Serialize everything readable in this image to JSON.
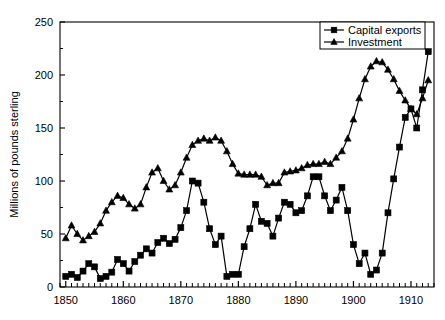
{
  "chart_data": {
    "type": "line",
    "title": "",
    "xlabel": "",
    "ylabel": "Millions of pounds sterling",
    "xlim": [
      1849,
      1914
    ],
    "ylim": [
      0,
      250
    ],
    "yticks": [
      0,
      50,
      100,
      150,
      200,
      250
    ],
    "xticks": [
      1850,
      1860,
      1870,
      1880,
      1890,
      1900,
      1910
    ],
    "xtick_labels": [
      "1850",
      "1860",
      "1870",
      "1880",
      "1890",
      "1900",
      "1910"
    ],
    "ytick_labels": [
      "0",
      "50",
      "100",
      "150",
      "200",
      "250"
    ],
    "minor_xticks": true,
    "grid": false,
    "legend_position": "top-right",
    "x": [
      1850,
      1851,
      1852,
      1853,
      1854,
      1855,
      1856,
      1857,
      1858,
      1859,
      1860,
      1861,
      1862,
      1863,
      1864,
      1865,
      1866,
      1867,
      1868,
      1869,
      1870,
      1871,
      1872,
      1873,
      1874,
      1875,
      1876,
      1877,
      1878,
      1879,
      1880,
      1881,
      1882,
      1883,
      1884,
      1885,
      1886,
      1887,
      1888,
      1889,
      1890,
      1891,
      1892,
      1893,
      1894,
      1895,
      1896,
      1897,
      1898,
      1899,
      1900,
      1901,
      1902,
      1903,
      1904,
      1905,
      1906,
      1907,
      1908,
      1909,
      1910,
      1911,
      1912,
      1913
    ],
    "series": [
      {
        "name": "Capital exports",
        "marker": "square",
        "color": "#000000",
        "values": [
          10,
          12,
          9,
          15,
          22,
          19,
          8,
          10,
          14,
          26,
          22,
          15,
          24,
          30,
          36,
          32,
          42,
          46,
          41,
          45,
          56,
          72,
          100,
          98,
          80,
          55,
          40,
          48,
          10,
          12,
          12,
          38,
          55,
          78,
          62,
          60,
          48,
          65,
          80,
          78,
          70,
          72,
          86,
          104,
          104,
          86,
          72,
          82,
          94,
          72,
          40,
          22,
          32,
          12,
          16,
          32,
          70,
          102,
          132,
          160,
          168,
          150,
          186,
          222
        ]
      },
      {
        "name": "Investment",
        "marker": "triangle",
        "color": "#000000",
        "values": [
          46,
          58,
          50,
          44,
          48,
          52,
          60,
          72,
          80,
          86,
          84,
          78,
          74,
          78,
          94,
          108,
          112,
          100,
          92,
          96,
          108,
          122,
          134,
          138,
          140,
          138,
          141,
          138,
          128,
          116,
          107,
          106,
          106,
          106,
          104,
          96,
          98,
          98,
          108,
          109,
          110,
          112,
          115,
          116,
          116,
          118,
          116,
          122,
          128,
          140,
          158,
          178,
          196,
          208,
          213,
          212,
          205,
          196,
          185,
          176,
          168,
          163,
          178,
          195
        ]
      }
    ]
  },
  "axes": {
    "ylabel": "Millions of pounds sterling"
  },
  "legend": {
    "items": [
      {
        "label": "Capital exports",
        "marker": "square"
      },
      {
        "label": "Investment",
        "marker": "triangle"
      }
    ]
  }
}
